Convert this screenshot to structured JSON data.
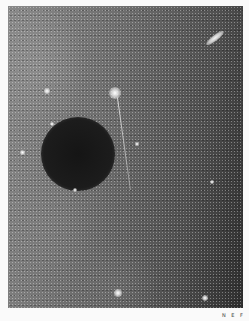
{
  "image": {
    "description": "Grayscale astronomical photographic plate: star field with a dark circular occulting disc, a bright star with a linear streak, and an elongated galaxy at upper right",
    "colors": {
      "border": "#fafafa",
      "sky_light": "#8a8a8a",
      "sky_dark": "#2e2e2e",
      "disc": "#151515"
    },
    "objects": [
      {
        "type": "dark-disc",
        "cx": 77,
        "cy": 155,
        "r": 36
      },
      {
        "type": "galaxy",
        "cx": 215,
        "cy": 38
      },
      {
        "type": "bright-star",
        "cx": 115,
        "cy": 94
      },
      {
        "type": "streak",
        "from": [
          117,
          98
        ],
        "to": [
          130,
          190
        ]
      },
      {
        "type": "star",
        "cx": 118,
        "cy": 293
      },
      {
        "type": "star",
        "cx": 205,
        "cy": 298
      },
      {
        "type": "star",
        "cx": 22,
        "cy": 152
      },
      {
        "type": "star",
        "cx": 52,
        "cy": 123
      },
      {
        "type": "star",
        "cx": 137,
        "cy": 143
      },
      {
        "type": "star",
        "cx": 212,
        "cy": 181
      },
      {
        "type": "star",
        "cx": 47,
        "cy": 90
      },
      {
        "type": "star",
        "cx": 75,
        "cy": 190
      }
    ],
    "corner_label": "N E F"
  }
}
